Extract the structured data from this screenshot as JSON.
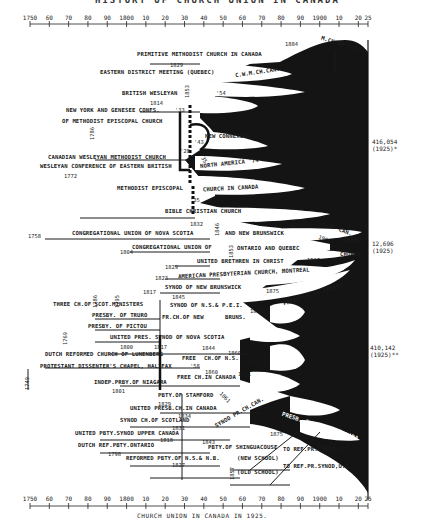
{
  "title_cut": "HISTORY OF CHURCH UNION IN CANADA",
  "axis": {
    "ticks": [
      "1750",
      "60",
      "70",
      "80",
      "90",
      "1800",
      "10",
      "20",
      "30",
      "40",
      "50",
      "60",
      "70",
      "80",
      "90",
      "1900",
      "10",
      "20",
      "25"
    ],
    "start_year": 1750,
    "end_year": 1925
  },
  "caption": "CHURCH UNION IN CANADA IN 1925.",
  "totals": {
    "methodist": {
      "value": "416,054",
      "year": "(1925)*"
    },
    "congregational": {
      "value": "12,696",
      "year": "(1925)"
    },
    "presbyterian": {
      "value": "410,142",
      "year": "(1925)**"
    }
  },
  "labels": {
    "primitive": "PRIMITIVE METHODIST CHURCH IN CANADA",
    "y1884a": "1884",
    "mch_can": "M.CH.OF CAN.",
    "y1829a": "1829",
    "eastern": "EASTERN DISTRICT MEETING (QUEBEC)",
    "cwm": "C.W.M.CH.CAN.",
    "y1853": "1853",
    "british": "BRITISH WESLEYAN",
    "y54": "'54",
    "y1814": "1814",
    "nygenesee": "NEW YORK AND GENESEE CONFS.",
    "y33": "'33",
    "mep": "OF METHODIST EPISCOPAL CHURCH",
    "y1786": "1786",
    "newconn": "NEW CONNEXION",
    "y43": "'43",
    "y28": "'28",
    "cwmc": "CANADIAN WESLEYAN METHODIST CHURCH",
    "y35a": "'35",
    "wceb": "WESLEYAN CONFERENCE OF EASTERN BRITISH",
    "na74": "NORTH AMERICA '74",
    "y1772": "1772",
    "mepis": "METHODIST EPISCOPAL",
    "chincan": "CHURCH IN CANADA",
    "y35b": "'35",
    "bible": "BIBLE CHRISTIAN CHURCH",
    "y1832": "1832",
    "y1846": "1846",
    "y1894": "1894",
    "y1758": "1758",
    "cuns": "CONGREGATIONAL UNION OF NOVA SCOTIA",
    "andnb": "AND NEW BRUNSWICK",
    "chofcan": "CH.OF CAN.",
    "y1906": "1906",
    "congr": "CONGR.",
    "y1804": "1804",
    "cuoq": "CONGREGATIONAL UNION OF",
    "y1853b": "1853",
    "ontq": "ONTARIO AND QUEBEC",
    "church": "CHURCH",
    "y1829b": "1829",
    "ub": "UNITED BRETHREN IN CHRIST",
    "y1907": "1907",
    "y1823": "1823",
    "apc": "AMERICAN PRESBYTERIAN CHURCH, MONTREAL",
    "y1817a": "1817",
    "snb": "SYNOD OF NEW BRUNSWICK",
    "y1875a": "1875",
    "presbcan": "PRESB.CH.IN CANADA",
    "y1786b": "1786",
    "y1795": "1795",
    "y1845": "1845",
    "tcsm": "THREE CH.OF SCOT.MINISTERS",
    "snspei": "SYNOD OF N.S.& P.E.I.",
    "ptruro": "PRESBY. OF TRURO",
    "prnew": "FR.CH.OF NEW",
    "bruns": "BRUNS.",
    "y1866a": "1866",
    "ppictou": "PRESBY. OF PICTOU",
    "y1769": "1769",
    "upsnova": "UNITED PRES. SYNOD OF NOVA SCOTIA",
    "y1800": "1800",
    "y1817b": "1817",
    "y1844": "1844",
    "y1860": "1860",
    "drcl": "DUTCH REFORMED CHURCH OF LUNENBERG",
    "fre": "FREE",
    "chofns": "CH.OF N.S.",
    "y58": "'58",
    "y1866b": "1866",
    "pdch": "PROTESTANT DISSENTER'S CHAPEL, HALIFAX",
    "y1749": "1749",
    "y1860b": "1860",
    "y1861": "1861",
    "freecan": "FREE CH.IN CANADA",
    "ipn": "INDEP.PRBY.OF NIAGARA",
    "y1801": "1801",
    "pstam": "PBTY.OF STAMFORD",
    "y1829c": "1829",
    "y1861b": "1861",
    "upcc": "UNITED PRESB.CH.IN CANADA",
    "y1834": "1834",
    "scs": "SYNOD CH.OF SCOTLAND",
    "scsfr": "SYNOD PR.CH.CAN.",
    "y1831": "1831",
    "upsuc": "UNITED PBTY.SYNOD UPPER CANADA",
    "y1818": "1818",
    "y1843": "1843",
    "y1875b": "1875",
    "presbcan2": "PRESB. CHURCH IN CANADA",
    "drpo": "DUTCH REF.PBTY.ONTARIO",
    "y1798": "1798",
    "pshin": "PBTY.OF SHINGUACOUSE",
    "newschool": "(NEW SCHOOL)",
    "torefus1": "TO REF.PR.SYNOD,U.S.",
    "rpns": "REFORMED PBTY.OF N.S.& N.B.",
    "y1827": "1827",
    "y1857": "1857",
    "oldschool": "(OLD SCHOOL)",
    "torefus2": "TO REF.PR.SYNOD,U.S."
  }
}
